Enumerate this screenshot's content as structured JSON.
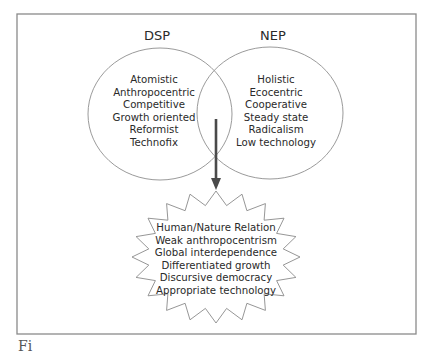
{
  "diagram": {
    "left_set": {
      "title": "DSP",
      "items": [
        "Atomistic",
        "Anthropocentric",
        "Competitive",
        "Growth oriented",
        "Reformist",
        "Technofix"
      ]
    },
    "right_set": {
      "title": "NEP",
      "items": [
        "Holistic",
        "Ecocentric",
        "Cooperative",
        "Steady state",
        "Radicalism",
        "Low technology"
      ]
    },
    "result": {
      "items": [
        "Human/Nature Relation",
        "Weak anthropocentrism",
        "Global interdependence",
        "Differentiated growth",
        "Discursive democracy",
        "Appropriate technology"
      ]
    },
    "colors": {
      "frame": "#8a8a8a",
      "circle_stroke": "#8f8f8f",
      "arrow": "#4a4a4a",
      "text": "#2a2a2a"
    }
  },
  "caption": {
    "text": "Fi"
  }
}
